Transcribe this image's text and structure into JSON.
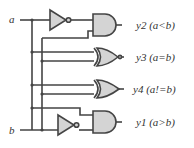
{
  "inputs": {
    "a": "a",
    "b": "b"
  },
  "outputs": [
    {
      "id": "y2",
      "label": "y2 (a<b)",
      "gate": "AND"
    },
    {
      "id": "y3",
      "label": "y3 (a=b)",
      "gate": "XNOR"
    },
    {
      "id": "y4",
      "label": "y4 (a!=b)",
      "gate": "XOR"
    },
    {
      "id": "y1",
      "label": "y1 (a>b)",
      "gate": "AND"
    }
  ],
  "colors": {
    "wire": "#444444",
    "gate_fill": "#d4d4d4",
    "background": "#ffffff"
  }
}
